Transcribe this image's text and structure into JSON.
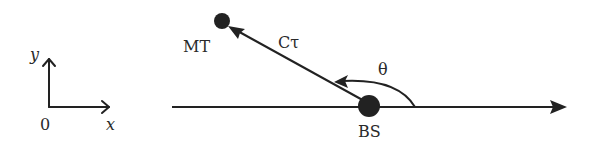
{
  "axes_legend": {
    "y_label": "y",
    "x_label": "x",
    "origin_label": "0"
  },
  "diagram": {
    "mobile_terminal_label": "MT",
    "base_station_label": "BS",
    "distance_label": "Cτ",
    "angle_label": "θ"
  },
  "colors": {
    "stroke": "#222222",
    "background": "#ffffff"
  }
}
